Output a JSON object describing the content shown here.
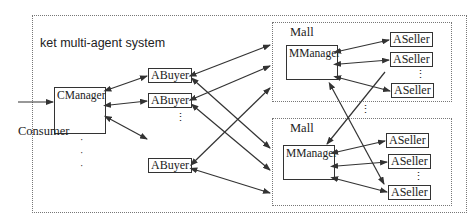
{
  "diagram": {
    "system_title": "ket multi-agent system",
    "consumer_label": "Consumer",
    "cmanager_label": "CManager",
    "buyers": [
      {
        "label": "ABuyer"
      },
      {
        "label": "ABuyer"
      },
      {
        "label": "ABuyer"
      }
    ],
    "malls": [
      {
        "title": "Mall",
        "manager_label": "MManager",
        "sellers": [
          {
            "label": "ASeller"
          },
          {
            "label": "ASeller"
          },
          {
            "label": "ASeller"
          }
        ]
      },
      {
        "title": "Mall",
        "manager_label": "MManager",
        "sellers": [
          {
            "label": "ASeller"
          },
          {
            "label": "ASeller"
          },
          {
            "label": "ASeller"
          }
        ]
      }
    ],
    "ellipsis": "⋮",
    "colors": {
      "line": "#333333",
      "border": "#777777"
    }
  }
}
